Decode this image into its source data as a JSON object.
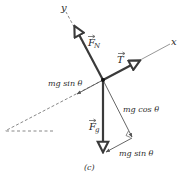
{
  "figure": {
    "caption": "(c)",
    "axes": {
      "x_label": "x",
      "y_label": "y"
    },
    "forces": {
      "normal": {
        "symbol": "F",
        "subscript": "N"
      },
      "tension": {
        "symbol": "T"
      },
      "gravity": {
        "symbol": "F",
        "subscript": "g"
      }
    },
    "components": {
      "parallel_label": "mg sin θ",
      "perpendicular_label": "mg cos θ",
      "parallel_label_bottom": "mg sin θ"
    },
    "colors": {
      "force_vector": "#3a3a3a",
      "axis_line": "#6a6a6a",
      "component": "#555555",
      "text": "#2a2a2a"
    }
  }
}
